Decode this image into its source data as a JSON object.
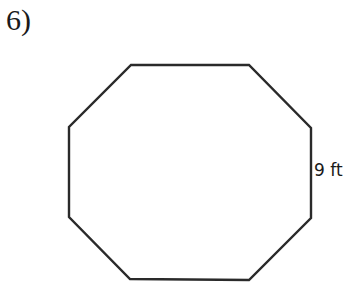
{
  "problem": {
    "number_label": "6)"
  },
  "figure": {
    "shape": "regular octagon",
    "side_label": "9 ft",
    "stroke_color": "#2a2a2a"
  }
}
